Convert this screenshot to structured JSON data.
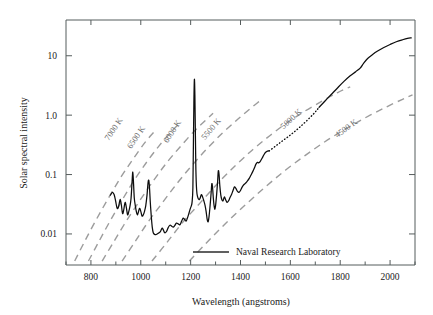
{
  "chart_data": {
    "type": "line",
    "title": "",
    "xlabel": "Wavelength (angstroms)",
    "ylabel": "Solar spectral intensity",
    "xlim": [
      700,
      2100
    ],
    "ylim": [
      0.003,
      40
    ],
    "yscale": "log",
    "grid": false,
    "xticks": [
      800,
      1000,
      1200,
      1400,
      1600,
      1800,
      2000
    ],
    "xtick_labels": [
      "800",
      "1000",
      "1200",
      "1400",
      "1600",
      "1800",
      "2000"
    ],
    "xminor_ticks": [
      700,
      900,
      1100,
      1300,
      1500,
      1700,
      1900,
      2100
    ],
    "yticks": [
      10,
      1.0,
      0.1,
      0.01
    ],
    "ytick_labels": [
      "10",
      "1.0",
      "0.1",
      "0.01"
    ],
    "legend": {
      "position": "bottom-center",
      "entries": [
        {
          "label": "Naval Research Laboratory",
          "style": "solid",
          "color": "#2b2b2b"
        }
      ]
    },
    "annotations": [
      {
        "text": "7000 K",
        "x": 900,
        "y": 0.55,
        "rotation": -56
      },
      {
        "text": "6500 K",
        "x": 990,
        "y": 0.4,
        "rotation": -56
      },
      {
        "text": "6000 K",
        "x": 1135,
        "y": 0.5,
        "rotation": -56
      },
      {
        "text": "5500 K",
        "x": 1290,
        "y": 0.55,
        "rotation": -50
      },
      {
        "text": "5000 K",
        "x": 1610,
        "y": 0.8,
        "rotation": -42
      },
      {
        "text": "4500 K",
        "x": 1830,
        "y": 0.55,
        "rotation": -36
      }
    ],
    "series": [
      {
        "name": "Naval Research Laboratory",
        "style": "solid",
        "color": "#0d0d0d",
        "points": [
          [
            878,
            0.045
          ],
          [
            886,
            0.05
          ],
          [
            893,
            0.046
          ],
          [
            899,
            0.036
          ],
          [
            905,
            0.027
          ],
          [
            911,
            0.029
          ],
          [
            917,
            0.038
          ],
          [
            922,
            0.031
          ],
          [
            927,
            0.022
          ],
          [
            932,
            0.026
          ],
          [
            937,
            0.034
          ],
          [
            942,
            0.028
          ],
          [
            947,
            0.021
          ],
          [
            952,
            0.024
          ],
          [
            957,
            0.03
          ],
          [
            961,
            0.04
          ],
          [
            965,
            0.075
          ],
          [
            968,
            0.11
          ],
          [
            971,
            0.07
          ],
          [
            974,
            0.04
          ],
          [
            978,
            0.03
          ],
          [
            982,
            0.024
          ],
          [
            986,
            0.021
          ],
          [
            990,
            0.023
          ],
          [
            995,
            0.027
          ],
          [
            1000,
            0.024
          ],
          [
            1005,
            0.02
          ],
          [
            1010,
            0.021
          ],
          [
            1015,
            0.024
          ],
          [
            1020,
            0.03
          ],
          [
            1025,
            0.045
          ],
          [
            1029,
            0.072
          ],
          [
            1032,
            0.08
          ],
          [
            1035,
            0.06
          ],
          [
            1038,
            0.035
          ],
          [
            1042,
            0.02
          ],
          [
            1046,
            0.013
          ],
          [
            1050,
            0.0105
          ],
          [
            1056,
            0.0098
          ],
          [
            1062,
            0.0098
          ],
          [
            1070,
            0.0103
          ],
          [
            1078,
            0.0108
          ],
          [
            1085,
            0.0125
          ],
          [
            1090,
            0.0118
          ],
          [
            1096,
            0.0105
          ],
          [
            1103,
            0.011
          ],
          [
            1110,
            0.0128
          ],
          [
            1117,
            0.014
          ],
          [
            1124,
            0.0135
          ],
          [
            1130,
            0.013
          ],
          [
            1136,
            0.0138
          ],
          [
            1143,
            0.0152
          ],
          [
            1150,
            0.0148
          ],
          [
            1157,
            0.0143
          ],
          [
            1164,
            0.0165
          ],
          [
            1170,
            0.0185
          ],
          [
            1176,
            0.0175
          ],
          [
            1182,
            0.0165
          ],
          [
            1188,
            0.019
          ],
          [
            1194,
            0.023
          ],
          [
            1199,
            0.027
          ],
          [
            1203,
            0.03
          ],
          [
            1206,
            0.035
          ],
          [
            1209,
            0.06
          ],
          [
            1211,
            0.3
          ],
          [
            1213,
            1.6
          ],
          [
            1215,
            4.0
          ],
          [
            1217,
            2.2
          ],
          [
            1219,
            0.5
          ],
          [
            1221,
            0.12
          ],
          [
            1224,
            0.055
          ],
          [
            1228,
            0.042
          ],
          [
            1233,
            0.038
          ],
          [
            1238,
            0.04
          ],
          [
            1243,
            0.046
          ],
          [
            1248,
            0.042
          ],
          [
            1253,
            0.036
          ],
          [
            1258,
            0.03
          ],
          [
            1262,
            0.024
          ],
          [
            1266,
            0.018
          ],
          [
            1270,
            0.016
          ],
          [
            1274,
            0.02
          ],
          [
            1278,
            0.03
          ],
          [
            1282,
            0.048
          ],
          [
            1285,
            0.07
          ],
          [
            1288,
            0.06
          ],
          [
            1291,
            0.04
          ],
          [
            1294,
            0.03
          ],
          [
            1297,
            0.026
          ],
          [
            1300,
            0.03
          ],
          [
            1304,
            0.045
          ],
          [
            1308,
            0.075
          ],
          [
            1311,
            0.115
          ],
          [
            1314,
            0.1
          ],
          [
            1317,
            0.065
          ],
          [
            1321,
            0.045
          ],
          [
            1325,
            0.038
          ],
          [
            1330,
            0.036
          ],
          [
            1335,
            0.042
          ],
          [
            1340,
            0.038
          ],
          [
            1346,
            0.034
          ],
          [
            1352,
            0.036
          ],
          [
            1358,
            0.041
          ],
          [
            1364,
            0.046
          ],
          [
            1370,
            0.054
          ],
          [
            1376,
            0.062
          ],
          [
            1382,
            0.058
          ],
          [
            1388,
            0.052
          ],
          [
            1394,
            0.05
          ],
          [
            1400,
            0.054
          ],
          [
            1407,
            0.062
          ],
          [
            1414,
            0.068
          ],
          [
            1421,
            0.072
          ],
          [
            1428,
            0.078
          ],
          [
            1435,
            0.086
          ],
          [
            1442,
            0.098
          ],
          [
            1449,
            0.112
          ],
          [
            1456,
            0.13
          ],
          [
            1462,
            0.15
          ],
          [
            1468,
            0.16
          ],
          [
            1474,
            0.158
          ],
          [
            1480,
            0.168
          ],
          [
            1487,
            0.19
          ],
          [
            1494,
            0.215
          ],
          [
            1500,
            0.235
          ],
          [
            1508,
            0.248
          ],
          [
            1515,
            0.25
          ]
        ]
      },
      {
        "name": "interpolated-segment",
        "style": "dotted",
        "color": "#0d0d0d",
        "points": [
          [
            1515,
            0.25
          ],
          [
            1540,
            0.3
          ],
          [
            1565,
            0.36
          ],
          [
            1590,
            0.43
          ],
          [
            1615,
            0.52
          ],
          [
            1640,
            0.64
          ],
          [
            1665,
            0.8
          ],
          [
            1690,
            1.02
          ],
          [
            1705,
            1.2
          ],
          [
            1715,
            1.35
          ]
        ]
      },
      {
        "name": "continuum-solid",
        "style": "solid",
        "color": "#0d0d0d",
        "points": [
          [
            1715,
            1.35
          ],
          [
            1740,
            1.75
          ],
          [
            1765,
            2.25
          ],
          [
            1790,
            2.9
          ],
          [
            1815,
            3.7
          ],
          [
            1840,
            4.6
          ],
          [
            1862,
            5.4
          ],
          [
            1880,
            6.2
          ],
          [
            1895,
            7.6
          ],
          [
            1910,
            9.0
          ],
          [
            1930,
            10.5
          ],
          [
            1950,
            12.0
          ],
          [
            1975,
            13.8
          ],
          [
            2000,
            15.5
          ],
          [
            2025,
            17.2
          ],
          [
            2050,
            18.6
          ],
          [
            2070,
            19.6
          ],
          [
            2085,
            20.0
          ]
        ]
      }
    ],
    "blackbody_curves": [
      {
        "name": "7000 K",
        "temperature_k": 7000,
        "style": "dashed",
        "color": "#9c9c9c",
        "points": [
          [
            735,
            0.0035
          ],
          [
            775,
            0.0075
          ],
          [
            820,
            0.017
          ],
          [
            870,
            0.04
          ],
          [
            920,
            0.09
          ],
          [
            970,
            0.185
          ],
          [
            1020,
            0.36
          ],
          [
            1060,
            0.56
          ]
        ]
      },
      {
        "name": "6500 K",
        "temperature_k": 6500,
        "style": "dashed",
        "color": "#9c9c9c",
        "points": [
          [
            790,
            0.0035
          ],
          [
            830,
            0.0072
          ],
          [
            875,
            0.016
          ],
          [
            925,
            0.037
          ],
          [
            975,
            0.082
          ],
          [
            1025,
            0.165
          ],
          [
            1075,
            0.31
          ],
          [
            1125,
            0.54
          ],
          [
            1155,
            0.72
          ]
        ]
      },
      {
        "name": "6000 K",
        "temperature_k": 6000,
        "style": "dashed",
        "color": "#9c9c9c",
        "points": [
          [
            845,
            0.0035
          ],
          [
            890,
            0.0072
          ],
          [
            940,
            0.016
          ],
          [
            995,
            0.036
          ],
          [
            1050,
            0.078
          ],
          [
            1105,
            0.16
          ],
          [
            1160,
            0.3
          ],
          [
            1215,
            0.54
          ],
          [
            1260,
            0.82
          ],
          [
            1290,
            1.08
          ]
        ]
      },
      {
        "name": "5500 K",
        "temperature_k": 5500,
        "style": "dashed",
        "color": "#9c9c9c",
        "points": [
          [
            925,
            0.0035
          ],
          [
            975,
            0.0072
          ],
          [
            1030,
            0.016
          ],
          [
            1090,
            0.035
          ],
          [
            1150,
            0.075
          ],
          [
            1210,
            0.15
          ],
          [
            1270,
            0.285
          ],
          [
            1330,
            0.51
          ],
          [
            1390,
            0.86
          ],
          [
            1440,
            1.3
          ],
          [
            1475,
            1.7
          ]
        ]
      },
      {
        "name": "5000 K",
        "temperature_k": 5000,
        "style": "dashed",
        "color": "#9c9c9c",
        "points": [
          [
            1045,
            0.0035
          ],
          [
            1105,
            0.0072
          ],
          [
            1170,
            0.016
          ],
          [
            1240,
            0.034
          ],
          [
            1310,
            0.072
          ],
          [
            1380,
            0.142
          ],
          [
            1450,
            0.265
          ],
          [
            1520,
            0.46
          ],
          [
            1590,
            0.76
          ],
          [
            1660,
            1.18
          ],
          [
            1730,
            1.75
          ],
          [
            1790,
            2.4
          ],
          [
            1840,
            3.0
          ]
        ]
      },
      {
        "name": "4500 K",
        "temperature_k": 4500,
        "style": "dashed",
        "color": "#9c9c9c",
        "points": [
          [
            1195,
            0.0035
          ],
          [
            1265,
            0.0072
          ],
          [
            1340,
            0.015
          ],
          [
            1420,
            0.031
          ],
          [
            1500,
            0.062
          ],
          [
            1580,
            0.118
          ],
          [
            1660,
            0.21
          ],
          [
            1740,
            0.36
          ],
          [
            1820,
            0.58
          ],
          [
            1900,
            0.9
          ],
          [
            1980,
            1.34
          ],
          [
            2050,
            1.85
          ],
          [
            2090,
            2.2
          ]
        ]
      }
    ]
  },
  "figure": {
    "background_color": "#ffffff",
    "frame_color": "#555c5c",
    "blackbody_color": "#9c9c9c",
    "spectrum_color": "#0d0d0d"
  }
}
